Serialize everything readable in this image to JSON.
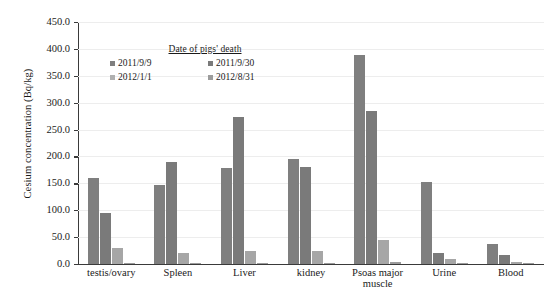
{
  "chart_data": {
    "type": "bar",
    "title": "",
    "xlabel": "",
    "ylabel": "Cesium concentration (Bq/kg)",
    "ylim": [
      0,
      450
    ],
    "ytick_step": 50,
    "grid": true,
    "legend_position": "inside-top-left",
    "legend_title": "Date of pigs' death",
    "categories": [
      "testis/ovary",
      "Spleen",
      "Liver",
      "kidney",
      "Psoas major muscle",
      "Urine",
      "Blood"
    ],
    "ytick_labels": [
      "450.0",
      "400.0",
      "350.0",
      "300.0",
      "250.0",
      "200.0",
      "150.0",
      "100.0",
      "50.0",
      "0.0"
    ],
    "series": [
      {
        "name": "2011/9/9",
        "color": "#7f7f7f",
        "values": [
          160.0,
          147.0,
          178.0,
          195.0,
          389.0,
          152.0,
          38.0
        ]
      },
      {
        "name": "2011/9/30",
        "color": "#7a7a7a",
        "values": [
          95.0,
          190.0,
          273.0,
          181.0,
          285.0,
          21.0,
          16.0
        ]
      },
      {
        "name": "2012/1/1",
        "color": "#a6a6a6",
        "values": [
          30.0,
          20.0,
          25.0,
          24.0,
          44.0,
          9.0,
          3.0
        ]
      },
      {
        "name": "2012/8/31",
        "color": "#9c9c9c",
        "values": [
          2.0,
          2.0,
          2.0,
          2.0,
          3.0,
          2.0,
          2.0
        ]
      }
    ]
  }
}
